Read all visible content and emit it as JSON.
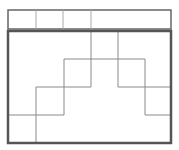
{
  "diagram": {
    "colors": {
      "border": "#555555",
      "grid": "#8a8a8a",
      "background": "#ffffff"
    },
    "header_strip": {
      "x": 8,
      "y": 10,
      "w": 163,
      "h": 19,
      "dividers_x": [
        36,
        63,
        91
      ]
    },
    "main_box": {
      "x": 8,
      "y": 31,
      "w": 163,
      "h": 112
    },
    "segments": [
      {
        "x1": 91,
        "y1": 31,
        "x2": 91,
        "y2": 87
      },
      {
        "x1": 118,
        "y1": 31,
        "x2": 118,
        "y2": 87
      },
      {
        "x1": 64,
        "y1": 59,
        "x2": 145,
        "y2": 59
      },
      {
        "x1": 64,
        "y1": 59,
        "x2": 64,
        "y2": 115
      },
      {
        "x1": 145,
        "y1": 59,
        "x2": 145,
        "y2": 115
      },
      {
        "x1": 36,
        "y1": 87,
        "x2": 91,
        "y2": 87
      },
      {
        "x1": 118,
        "y1": 87,
        "x2": 171,
        "y2": 87
      },
      {
        "x1": 36,
        "y1": 87,
        "x2": 36,
        "y2": 143
      },
      {
        "x1": 8,
        "y1": 115,
        "x2": 64,
        "y2": 115
      },
      {
        "x1": 145,
        "y1": 115,
        "x2": 171,
        "y2": 115
      }
    ]
  }
}
